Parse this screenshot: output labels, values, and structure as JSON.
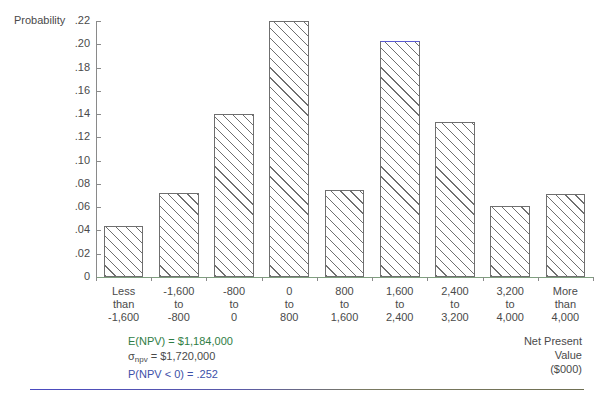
{
  "chart_data": {
    "type": "bar",
    "title": "",
    "xlabel": "Net Present Value ($000)",
    "ylabel": "Probability",
    "ylim": [
      0,
      0.22
    ],
    "grid": false,
    "legend": "none",
    "categories": [
      "Less than -1,600",
      "-1,600 to -800",
      "-800 to 0",
      "0 to 800",
      "800 to 1,600",
      "1,600 to 2,400",
      "2,400 to 3,200",
      "3,200 to 4,000",
      "More than 4,000"
    ],
    "category_lines": [
      [
        "Less",
        "than",
        "-1,600"
      ],
      [
        "-1,600",
        "to",
        "-800"
      ],
      [
        "-800",
        "to",
        "0"
      ],
      [
        "0",
        "to",
        "800"
      ],
      [
        "800",
        "to",
        "1,600"
      ],
      [
        "1,600",
        "to",
        "2,400"
      ],
      [
        "2,400",
        "to",
        "3,200"
      ],
      [
        "3,200",
        "to",
        "4,000"
      ],
      [
        "More",
        "than",
        "4,000"
      ]
    ],
    "values": [
      0.044,
      0.072,
      0.14,
      0.22,
      0.075,
      0.203,
      0.133,
      0.061,
      0.071
    ],
    "ytick_values": [
      0.22,
      0.2,
      0.18,
      0.16,
      0.14,
      0.12,
      0.1,
      0.08,
      0.06,
      0.04,
      0.02,
      0
    ],
    "ytick_labels": [
      ".22",
      ".20",
      ".18",
      ".16",
      ".14",
      ".12",
      ".10",
      ".08",
      ".06",
      ".04",
      ".02",
      "0"
    ],
    "annotations": [
      "E(NPV) = $1,184,000",
      "σnpv = $1,720,000",
      "P(NPV < 0) = .252"
    ]
  },
  "axes": {
    "y_title": "Probability",
    "x_title_lines": [
      "Net Present",
      "Value",
      "($000)"
    ]
  },
  "annotations": {
    "expected_value": {
      "prefix": "E(NPV) = ",
      "value": "$1,184,000",
      "full": "E(NPV) = $1,184,000"
    },
    "std_dev": {
      "symbol": "σ",
      "subscript": "npv",
      "rest": " = $1,720,000",
      "full": "σnpv = $1,720,000"
    },
    "probability_negative": {
      "full": "P(NPV < 0) = .252"
    }
  },
  "colors": {
    "bar_border": "#6f6f6f",
    "bar_accent": "#5a5ad0",
    "axis": "#8a8a8a",
    "x_axis": "#7f9f7f",
    "text": "#4a4a4a",
    "annotation_green": "#2f7d45",
    "annotation_blue": "#3d4fa8",
    "rule": "#4a4ac0"
  }
}
